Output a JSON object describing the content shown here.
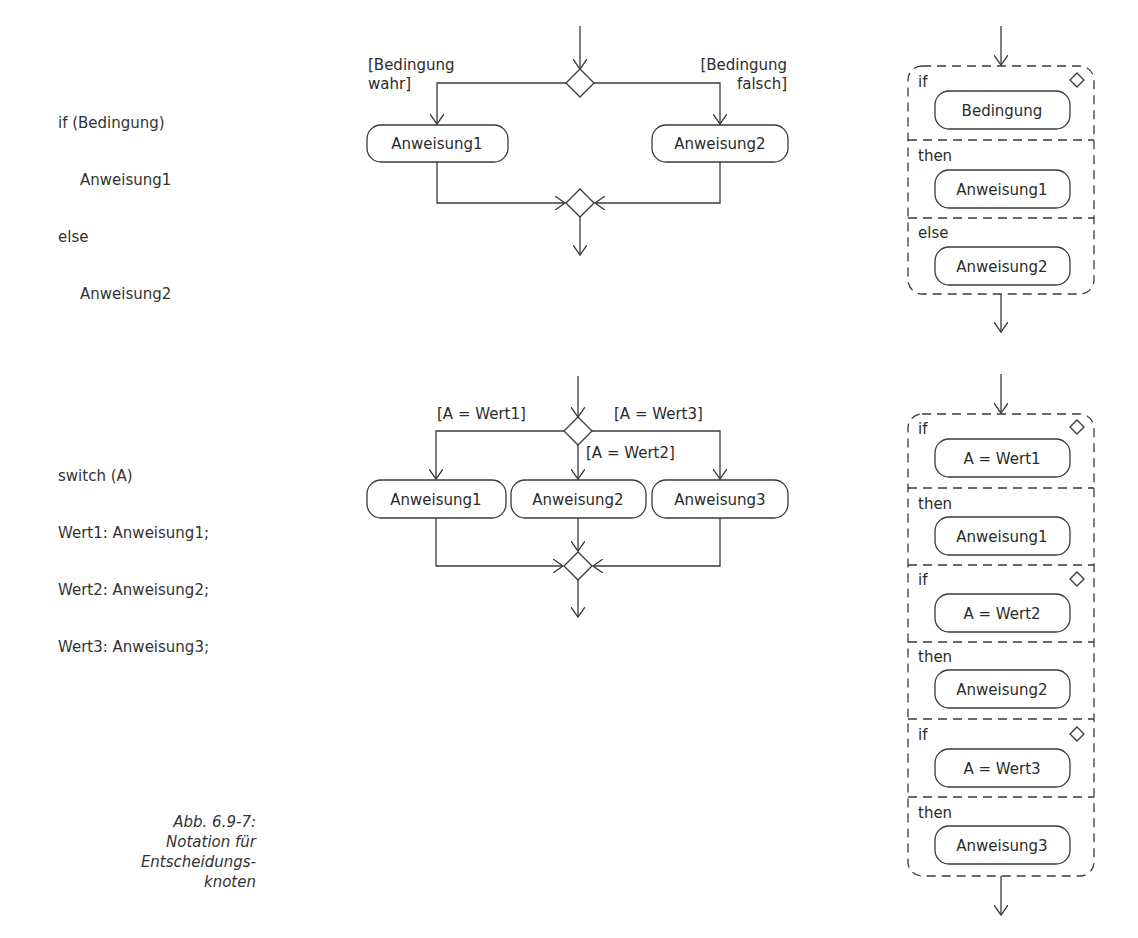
{
  "if_code": {
    "lines": [
      "if (Bedingung)",
      "Anweisung1",
      "else",
      "Anweisung2"
    ]
  },
  "switch_code": {
    "lines": [
      "switch (A)",
      "Wert1: Anweisung1;",
      "Wert2: Anweisung2;",
      "Wert3: Anweisung3;"
    ]
  },
  "if_activity": {
    "guard_true_line1": "[Bedingung",
    "guard_true_line2": "wahr]",
    "guard_false_line1": "[Bedingung",
    "guard_false_line2": "falsch]",
    "action1": "Anweisung1",
    "action2": "Anweisung2"
  },
  "switch_activity": {
    "guard1": "[A = Wert1]",
    "guard2": "[A = Wert2]",
    "guard3": "[A = Wert3]",
    "action1": "Anweisung1",
    "action2": "Anweisung2",
    "action3": "Anweisung3"
  },
  "if_conditional_node": {
    "sections": [
      {
        "keyword": "if",
        "content": "Bedingung"
      },
      {
        "keyword": "then",
        "content": "Anweisung1"
      },
      {
        "keyword": "else",
        "content": "Anweisung2"
      }
    ]
  },
  "switch_conditional_node": {
    "sections": [
      {
        "keyword": "if",
        "content": "A = Wert1"
      },
      {
        "keyword": "then",
        "content": "Anweisung1"
      },
      {
        "keyword": "if",
        "content": "A = Wert2"
      },
      {
        "keyword": "then",
        "content": "Anweisung2"
      },
      {
        "keyword": "if",
        "content": "A = Wert3"
      },
      {
        "keyword": "then",
        "content": "Anweisung3"
      }
    ]
  },
  "caption": {
    "line1": "Abb. 6.9-7:",
    "line2": "Notation für",
    "line3": "Entscheidungs-",
    "line4": "knoten"
  }
}
